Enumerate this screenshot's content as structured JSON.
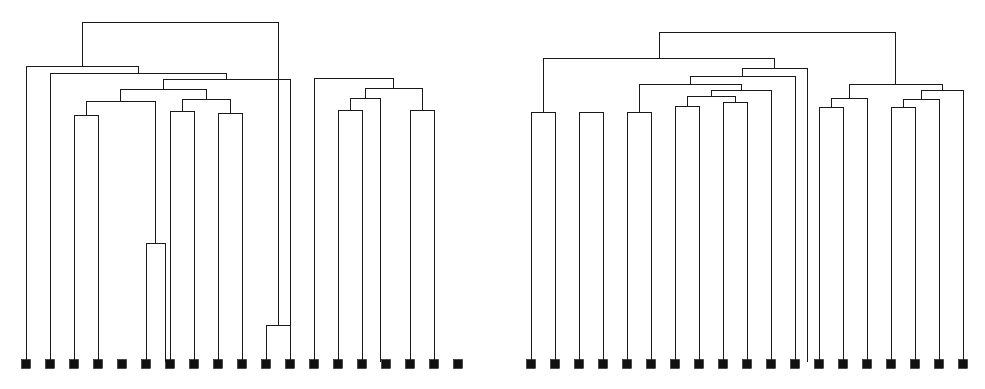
{
  "figure": {
    "title": "",
    "background_color": "#ffffff",
    "line_color": "#1a1a1a",
    "marker_color": "#111111",
    "width": 985,
    "height": 389,
    "panel_count": 2
  },
  "chart_data": {
    "type": "line",
    "chart_subtype": "dendrogram",
    "title": "",
    "subtitle": "",
    "xlabel": "",
    "ylabel": "",
    "grid": false,
    "legend": null,
    "orientation": "top-down",
    "axis_visible": false,
    "tick_labels": [],
    "annotations": [],
    "panels": [
      {
        "name": "left-dendrogram",
        "label": "",
        "leaf_count": 19,
        "leaf_marker": "filled-square",
        "leaf_marker_size": 9,
        "leaf_baseline_y": 362,
        "leaf_x": [
          26,
          50,
          74,
          98,
          122,
          146,
          170,
          194,
          218,
          242,
          266,
          290,
          314,
          338,
          362,
          386,
          410,
          434,
          458
        ],
        "root_y": 22,
        "merges": [
          {
            "id": "m1",
            "x1": 146,
            "x2": 165,
            "y": 243,
            "note": "deep pair merge"
          },
          {
            "id": "m2",
            "x1": 266,
            "x2": 290,
            "y": 325,
            "note": "deep pair merge"
          },
          {
            "id": "m3",
            "x1": 74,
            "x2": 98,
            "y": 115
          },
          {
            "id": "m4",
            "x1": 170,
            "x2": 194,
            "y": 111
          },
          {
            "id": "m5",
            "x1": 218,
            "x2": 242,
            "y": 113
          },
          {
            "id": "m6",
            "x1": 338,
            "x2": 362,
            "y": 110
          },
          {
            "id": "m7",
            "x1": 410,
            "x2": 434,
            "y": 110
          },
          {
            "id": "m8",
            "x1": 86,
            "x2": 155,
            "y": 101
          },
          {
            "id": "m9",
            "x1": 182,
            "x2": 230,
            "y": 99
          },
          {
            "id": "m10",
            "x1": 350,
            "x2": 380,
            "y": 98
          },
          {
            "id": "m11",
            "x1": 120,
            "x2": 206,
            "y": 89
          },
          {
            "id": "m12",
            "x1": 365,
            "x2": 422,
            "y": 88
          },
          {
            "id": "m13",
            "x1": 163,
            "x2": 290,
            "y": 79
          },
          {
            "id": "m14",
            "x1": 314,
            "x2": 393,
            "y": 78
          },
          {
            "id": "m15",
            "x1": 50,
            "x2": 226,
            "y": 73
          },
          {
            "id": "m16",
            "x1": 26,
            "x2": 138,
            "y": 66
          },
          {
            "id": "m17",
            "x1": 82,
            "x2": 278,
            "y": 22,
            "note": "root"
          }
        ]
      },
      {
        "name": "right-dendrogram",
        "label": "",
        "leaf_count": 19,
        "leaf_marker": "filled-square",
        "leaf_marker_size": 9,
        "leaf_baseline_y": 362,
        "leaf_x": [
          38,
          62,
          86,
          110,
          134,
          158,
          182,
          206,
          230,
          254,
          278,
          302,
          326,
          350,
          374,
          398,
          422,
          446,
          470
        ],
        "root_y": 32,
        "merges": [
          {
            "id": "r1",
            "x1": 38,
            "x2": 62,
            "y": 112
          },
          {
            "id": "r2",
            "x1": 86,
            "x2": 110,
            "y": 112
          },
          {
            "id": "r3",
            "x1": 134,
            "x2": 158,
            "y": 112
          },
          {
            "id": "r4",
            "x1": 182,
            "x2": 206,
            "y": 106
          },
          {
            "id": "r5",
            "x1": 230,
            "x2": 254,
            "y": 102
          },
          {
            "id": "r6",
            "x1": 326,
            "x2": 350,
            "y": 107
          },
          {
            "id": "r7",
            "x1": 398,
            "x2": 422,
            "y": 107
          },
          {
            "id": "r8",
            "x1": 194,
            "x2": 242,
            "y": 96
          },
          {
            "id": "r9",
            "x1": 338,
            "x2": 374,
            "y": 98
          },
          {
            "id": "r10",
            "x1": 410,
            "x2": 446,
            "y": 99
          },
          {
            "id": "r11",
            "x1": 218,
            "x2": 278,
            "y": 90
          },
          {
            "id": "r12",
            "x1": 428,
            "x2": 470,
            "y": 90
          },
          {
            "id": "r13",
            "x1": 146,
            "x2": 248,
            "y": 84
          },
          {
            "id": "r14",
            "x1": 356,
            "x2": 449,
            "y": 84
          },
          {
            "id": "r15",
            "x1": 197,
            "x2": 302,
            "y": 76
          },
          {
            "id": "r16",
            "x1": 249,
            "x2": 314,
            "y": 68
          },
          {
            "id": "r17",
            "x1": 50,
            "x2": 281,
            "y": 58
          },
          {
            "id": "r18",
            "x1": 166,
            "x2": 402,
            "y": 32,
            "note": "root"
          }
        ]
      }
    ]
  }
}
